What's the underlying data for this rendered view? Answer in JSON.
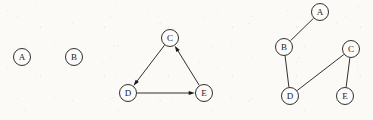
{
  "figure": {
    "background_color": "#fbfaf7",
    "ink_color": "#1a1a1a",
    "node_fill": "#fdfcfa",
    "node_radius": 8.5,
    "panels": [
      {
        "id": "isolated-nodes",
        "name": "isolated-vertices",
        "graph_type": "undirected",
        "nodes": [
          {
            "id": "A",
            "label": "A",
            "cx": 22,
            "cy": 57
          },
          {
            "id": "B",
            "label": "B",
            "cx": 74,
            "cy": 57
          }
        ],
        "edges": []
      },
      {
        "id": "directed-cycle",
        "name": "directed-cycle-graph",
        "graph_type": "directed",
        "nodes": [
          {
            "id": "C",
            "label": "C",
            "cx": 170,
            "cy": 38
          },
          {
            "id": "D",
            "label": "D",
            "cx": 128,
            "cy": 93
          },
          {
            "id": "E",
            "label": "E",
            "cx": 204,
            "cy": 93
          }
        ],
        "edges": [
          {
            "from": "C",
            "to": "D",
            "directed": true
          },
          {
            "from": "D",
            "to": "E",
            "directed": true
          },
          {
            "from": "E",
            "to": "C",
            "directed": true
          }
        ]
      },
      {
        "id": "undirected-tree",
        "name": "undirected-path-graph",
        "graph_type": "undirected",
        "nodes": [
          {
            "id": "A",
            "label": "A",
            "cx": 320,
            "cy": 12
          },
          {
            "id": "B",
            "label": "B",
            "cx": 284,
            "cy": 47
          },
          {
            "id": "C",
            "label": "C",
            "cx": 351,
            "cy": 49
          },
          {
            "id": "D",
            "label": "D",
            "cx": 290,
            "cy": 96
          },
          {
            "id": "E",
            "label": "E",
            "cx": 345,
            "cy": 96
          }
        ],
        "edges": [
          {
            "from": "A",
            "to": "B",
            "directed": false
          },
          {
            "from": "B",
            "to": "D",
            "directed": false
          },
          {
            "from": "D",
            "to": "C",
            "directed": false
          },
          {
            "from": "C",
            "to": "E",
            "directed": false
          }
        ]
      }
    ]
  }
}
